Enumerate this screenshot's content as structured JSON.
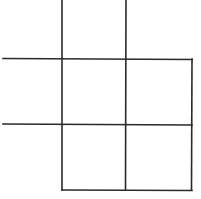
{
  "diagram": {
    "line_color": "#2a2a2a",
    "background": "#ffffff",
    "segments": [
      {
        "name": "vertical-line-left",
        "orientation": "vertical"
      },
      {
        "name": "vertical-line-middle",
        "orientation": "vertical"
      },
      {
        "name": "vertical-line-right",
        "orientation": "vertical"
      },
      {
        "name": "horizontal-line-top",
        "orientation": "horizontal"
      },
      {
        "name": "horizontal-line-middle",
        "orientation": "horizontal"
      },
      {
        "name": "horizontal-line-bottom",
        "orientation": "horizontal"
      }
    ]
  }
}
